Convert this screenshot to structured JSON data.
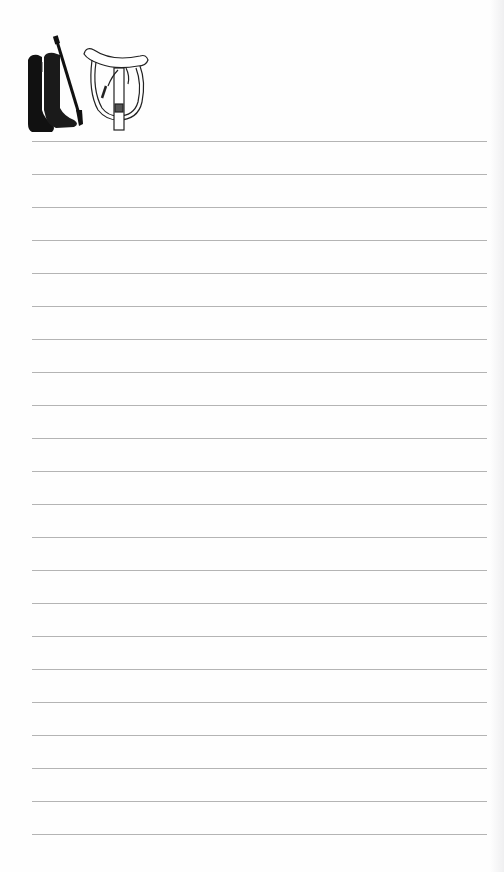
{
  "notepad": {
    "illustration": {
      "items": [
        "riding-boots",
        "riding-crop",
        "english-saddle"
      ]
    },
    "ruled_lines": {
      "count": 22,
      "first_y": 141,
      "spacing": 33,
      "left_x": 32,
      "right_x": 487,
      "color": "#b4b4b4"
    },
    "background_color": "#ffffff"
  }
}
